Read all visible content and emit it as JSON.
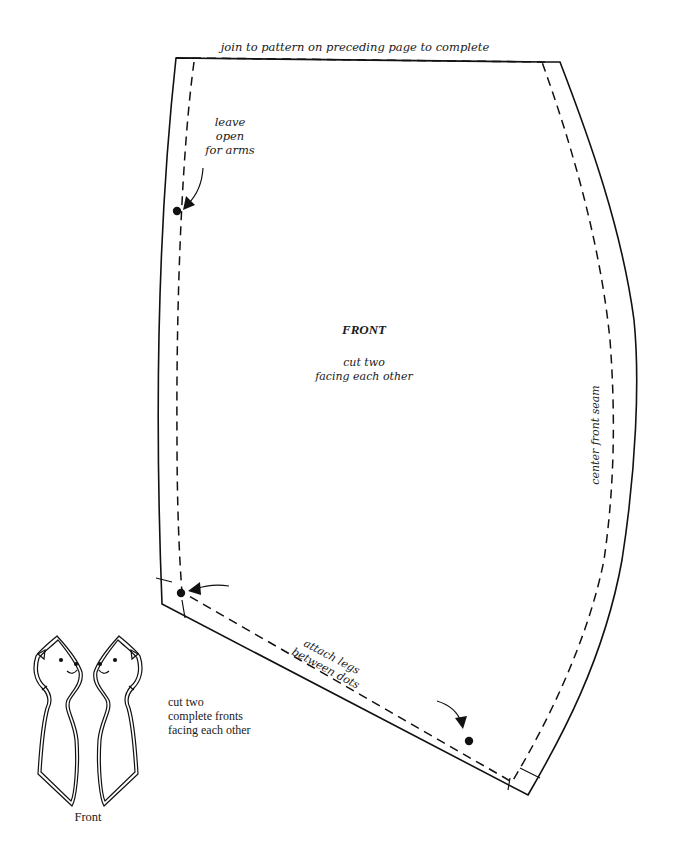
{
  "pattern_piece": {
    "title": "FRONT",
    "instruction_lines": [
      "cut two",
      "facing each other"
    ],
    "top_note": "join to pattern on preceding page to complete",
    "side_label": "center front seam",
    "arm_note_lines": [
      "leave",
      "open",
      "for arms"
    ],
    "legs_note_lines": [
      "attach legs",
      "between dots"
    ]
  },
  "thumbnail": {
    "caption": "Front",
    "instruction_lines": [
      "cut two",
      "complete fronts",
      "facing each other"
    ]
  },
  "colors": {
    "ink": "#111111",
    "paper": "#ffffff"
  }
}
